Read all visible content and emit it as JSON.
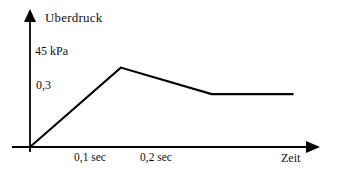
{
  "chart_data": {
    "type": "line",
    "title": "",
    "subtitle": "",
    "xlabel": "Zeit",
    "ylabel": "Uberdruck",
    "grid": false,
    "legend": null,
    "xlim": [
      0,
      0.295
    ],
    "ylim": [
      0,
      0.55
    ],
    "x_unit": "sec",
    "y_unit": "kPa",
    "x_tick_labels": [
      "0,1 sec",
      "0,2 sec"
    ],
    "x_tick_values": [
      0.1,
      0.2
    ],
    "y_tick_labels": [
      "45  kPa",
      "0,3"
    ],
    "y_tick_values": [
      0.45,
      0.3
    ],
    "series": [
      {
        "name": "Uberdruck",
        "color": "#000000",
        "x": [
          0,
          0.1,
          0.2,
          0.29
        ],
        "y": [
          0,
          0.45,
          0.3,
          0.3
        ],
        "points": [
          {
            "x": 0,
            "y": 0,
            "label": "origin"
          },
          {
            "x": 0.1,
            "y": 0.45,
            "label": "peak 45 kPa"
          },
          {
            "x": 0.2,
            "y": 0.3,
            "label": "plateau start 0,3"
          },
          {
            "x": 0.29,
            "y": 0.3,
            "label": "plateau end 0,3"
          }
        ]
      }
    ]
  },
  "axes": {
    "y_axis_title": "Uberdruck",
    "x_axis_title": "Zeit",
    "y_tick_top_label": "45  kPa",
    "y_tick_mid_label": "0,3",
    "x_tick_first_label": "0,1 sec",
    "x_tick_second_label": "0,2 sec"
  },
  "style": {
    "background_color": "#ffffff",
    "line_color": "#000000",
    "axis_color": "#000000",
    "text_color": "#111111"
  }
}
